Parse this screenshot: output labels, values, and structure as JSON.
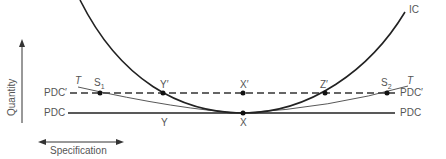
{
  "diagram": {
    "axes": {
      "vertical_label": "Quantity",
      "horizontal_label": "Specification"
    },
    "curves": {
      "indifference_curve": "IC",
      "tangent_left": "T",
      "tangent_right": "T"
    },
    "lines": {
      "pdc_prime": "PDC′",
      "pdc": "PDC"
    },
    "points": {
      "s1": "S",
      "s1_sub": "1",
      "s2": "S",
      "s2_sub": "2",
      "y_prime": "Y′",
      "x_prime": "X′",
      "z_prime": "Z′",
      "y": "Y",
      "x": "X"
    },
    "colors": {
      "line": "#222222",
      "label": "#555555",
      "background": "#ffffff"
    }
  }
}
